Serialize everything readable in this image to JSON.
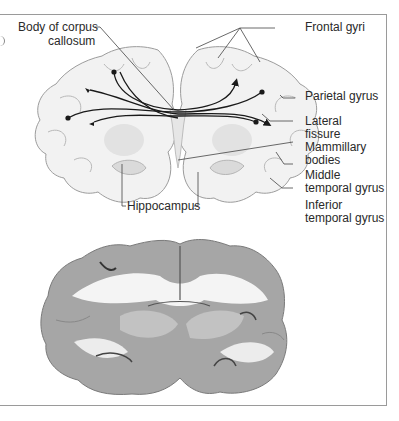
{
  "figure": {
    "type": "coronal brain section — schematic and photograph",
    "labels": {
      "corpus_callosum_line1": "Body of corpus",
      "corpus_callosum_line2": "callosum",
      "frontal_gyri": "Frontal gyri",
      "parietal_gyrus": "Parietal gyrus",
      "lateral_fissure_line1": "Lateral",
      "lateral_fissure_line2": "fissure",
      "mammillary_line1": "Mammillary",
      "mammillary_line2": "bodies",
      "middle_temporal_line1": "Middle",
      "middle_temporal_line2": "temporal gyrus",
      "inferior_temporal_line1": "Inferior",
      "inferior_temporal_line2": "temporal gyrus",
      "hippocampus": "Hippocampus"
    },
    "colors": {
      "tissue_light": "#f2f2f2",
      "tissue_outline": "#9c9c9c",
      "gray_matter": "#d8d8d8",
      "fibers": "#1a1a1a",
      "photo_gray": "#9a9a9a",
      "photo_white": "#f4f4f4",
      "frame": "#9a9a9a"
    }
  }
}
